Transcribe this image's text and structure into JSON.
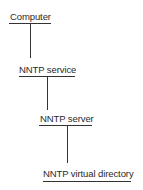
{
  "diagram": {
    "type": "hierarchy",
    "line_color": "#333333",
    "text_color": "#2a2a2a",
    "nodes": [
      {
        "label": "Computer",
        "level": 0
      },
      {
        "label": "NNTP service",
        "level": 1
      },
      {
        "label": "NNTP server",
        "level": 2
      },
      {
        "label": "NNTP virtual directory",
        "level": 3
      }
    ],
    "edges": [
      {
        "from": "Computer",
        "to": "NNTP service"
      },
      {
        "from": "NNTP service",
        "to": "NNTP server"
      },
      {
        "from": "NNTP server",
        "to": "NNTP virtual directory"
      }
    ]
  }
}
